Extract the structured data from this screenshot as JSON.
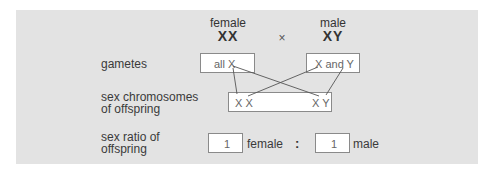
{
  "cross": {
    "female_label": "female",
    "female_genotype": "XX",
    "cross_symbol": "×",
    "male_label": "male",
    "male_genotype": "XY"
  },
  "rows": {
    "gametes_label": "gametes",
    "offspring_label_line1": "sex chromosomes",
    "offspring_label_line2": "of offspring",
    "ratio_label_line1": "sex ratio of",
    "ratio_label_line2": "offspring"
  },
  "gametes": {
    "female": "all X",
    "male": "X and Y"
  },
  "offspring": {
    "female": "X X",
    "male": "X Y"
  },
  "ratio": {
    "female_value": "1",
    "female_word": "female",
    "separator": ":",
    "male_value": "1",
    "male_word": "male"
  }
}
